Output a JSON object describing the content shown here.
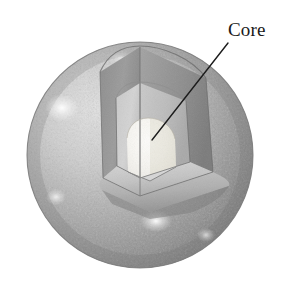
{
  "figure": {
    "name": "planet-interior-cutaway",
    "background_color": "#ffffff",
    "width": 296,
    "height": 285
  },
  "sphere": {
    "name": "planet-body",
    "center_x": 140,
    "center_y": 155,
    "radius": 113,
    "surface_color_light": "#d8d8d8",
    "surface_color_mid": "#a8a8a8",
    "surface_color_dark": "#6e6e6e",
    "outline_color": "#6a6a6a"
  },
  "layers": [
    {
      "name": "crust-mantle-outer",
      "label": "",
      "fill": "#8f8f8f",
      "radius": 113
    },
    {
      "name": "mantle-inner",
      "label": "",
      "fill": "#c6c6c6",
      "radius": 74
    },
    {
      "name": "core",
      "label": "Core",
      "fill": "#f2f0ea",
      "radius": 40
    }
  ],
  "callouts": [
    {
      "name": "core-callout",
      "text": "Core",
      "label_x": 228,
      "label_y": 20,
      "leader_start_x": 228,
      "leader_start_y": 43,
      "leader_end_x": 152,
      "leader_end_y": 140,
      "leader_color": "#1c1c1c",
      "leader_width": 1.4
    }
  ],
  "cutaway": {
    "name": "wedge-cut",
    "description": "Octant wedge removed from the front-upper region exposing layered interior",
    "cut_plane_fill": "#b4b4b4",
    "cut_plane_shadow": "#8a8a8a"
  },
  "highlights": [
    {
      "name": "specular-upper-left",
      "cx": 62,
      "cy": 108,
      "r": 16
    },
    {
      "name": "specular-lower-center",
      "cx": 155,
      "cy": 222,
      "r": 14
    },
    {
      "name": "specular-left-lower",
      "cx": 58,
      "cy": 196,
      "r": 9
    }
  ]
}
